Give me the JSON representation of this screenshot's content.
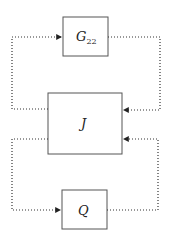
{
  "diagram": {
    "type": "block-diagram",
    "blocks": [
      {
        "id": "G22",
        "label": "G",
        "subscript": "22"
      },
      {
        "id": "J",
        "label": "J",
        "subscript": ""
      },
      {
        "id": "Q",
        "label": "Q",
        "subscript": ""
      }
    ],
    "connections": [
      {
        "from": "J",
        "to": "G22",
        "style": "dotted",
        "route": "left loop"
      },
      {
        "from": "G22",
        "to": "J",
        "style": "dotted",
        "route": "right loop"
      },
      {
        "from": "J",
        "to": "Q",
        "style": "dotted",
        "route": "left loop"
      },
      {
        "from": "Q",
        "to": "J",
        "style": "dotted",
        "route": "right loop"
      }
    ],
    "colors": {
      "box_stroke": "#555555",
      "wire": "#333333",
      "background": "#ffffff"
    }
  }
}
